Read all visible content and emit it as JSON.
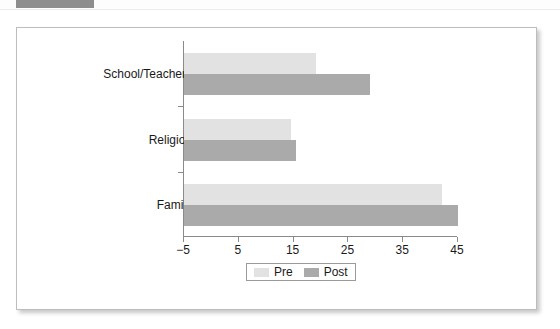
{
  "page": {
    "header_strip_present": true,
    "header_block_color": "#8e8e8e"
  },
  "legend": {
    "entries": [
      {
        "label": "Pre",
        "color": "#e2e2e2"
      },
      {
        "label": "Post",
        "color": "#aaaaaa"
      }
    ]
  },
  "axis": {
    "x_ticks": [
      "-5",
      "5",
      "15",
      "25",
      "35",
      "45"
    ],
    "x_tick_values": [
      -5,
      5,
      15,
      25,
      35,
      45
    ]
  },
  "chart_data": {
    "type": "bar",
    "orientation": "horizontal",
    "title": "",
    "subtitle": "",
    "xlabel": "",
    "ylabel": "",
    "categories": [
      "School/Teachers",
      "Religion",
      "Family"
    ],
    "series": [
      {
        "name": "Pre",
        "color": "#e2e2e2",
        "values": [
          19,
          14.5,
          42
        ]
      },
      {
        "name": "Post",
        "color": "#aaaaaa",
        "values": [
          29,
          15.5,
          45
        ]
      }
    ],
    "xlim": [
      -5,
      45
    ],
    "xticks": [
      -5,
      5,
      15,
      25,
      35,
      45
    ],
    "grid": false,
    "legend_position": "bottom-center"
  }
}
